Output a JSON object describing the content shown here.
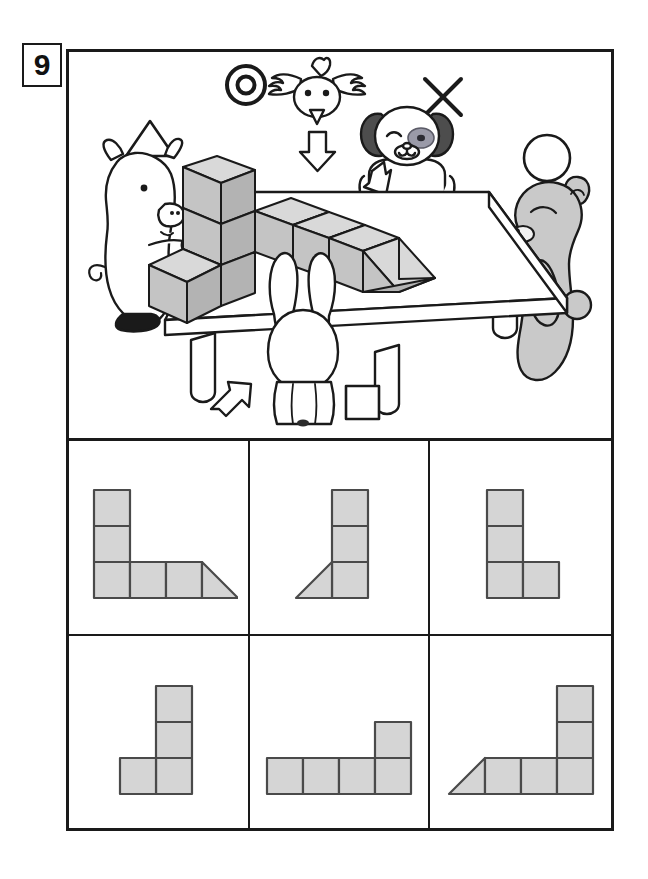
{
  "worksheet": {
    "question_number": "9",
    "colors": {
      "ink": "#1a1a1a",
      "shape_fill": "#d5d5d5",
      "shape_stroke": "#4a4a4a",
      "bear_fill": "#c9c9c9",
      "cube_top_fill": "#d9d9d9",
      "cube_front_fill": "#c4c4c4",
      "cube_side_fill": "#b3b3b3",
      "dog_ear_fill": "#4d4d4d",
      "white": "#ffffff"
    }
  },
  "scene": {
    "description": "Four animals stand around a table viewing a block structure; each animal is tagged with a symbol and an arrow showing its viewing direction.",
    "structure": {
      "name": "block-structure",
      "parts": "tall column of three cubes at left, row of three cubes extending right, ending in a triangular wedge",
      "cube_count": 6,
      "wedge_count": 1
    },
    "characters": [
      {
        "id": "pig",
        "name": "pig",
        "symbol": "triangle",
        "symbol_glyph": "△",
        "position": "left",
        "arrow_direction": "right"
      },
      {
        "id": "bird",
        "name": "bird",
        "symbol": "double-circle",
        "symbol_glyph": "◎",
        "position": "top",
        "arrow_direction": "down"
      },
      {
        "id": "dog",
        "name": "dog",
        "symbol": "cross",
        "symbol_glyph": "✕",
        "position": "back",
        "arrow_direction": "down-left"
      },
      {
        "id": "bear",
        "name": "bear",
        "symbol": "circle",
        "symbol_glyph": "○",
        "position": "right",
        "arrow_direction": "left"
      },
      {
        "id": "rabbit",
        "name": "rabbit",
        "symbol": "square",
        "symbol_glyph": "□",
        "position": "front",
        "arrow_direction": "up-right"
      }
    ]
  },
  "answer_options": [
    {
      "id": "option-1",
      "label": "1",
      "shape": "two squares stacked at left over a row of three squares ending in a right triangle",
      "squares": 5,
      "triangles": 1
    },
    {
      "id": "option-2",
      "label": "2",
      "shape": "vertical column of three squares with a right triangle at the lower left",
      "squares": 3,
      "triangles": 1
    },
    {
      "id": "option-3",
      "label": "3",
      "shape": "L shape: column of three squares with one square to the right of the bottom",
      "squares": 4,
      "triangles": 0
    },
    {
      "id": "option-4",
      "label": "4",
      "shape": "J shape: column of three squares with one square to the left of the bottom",
      "squares": 4,
      "triangles": 0
    },
    {
      "id": "option-5",
      "label": "5",
      "shape": "row of four squares with one square stacked on the rightmost",
      "squares": 5,
      "triangles": 0
    },
    {
      "id": "option-6",
      "label": "6",
      "shape": "right triangle then three squares in a row with two squares stacked on the rightmost",
      "squares": 5,
      "triangles": 1
    }
  ]
}
